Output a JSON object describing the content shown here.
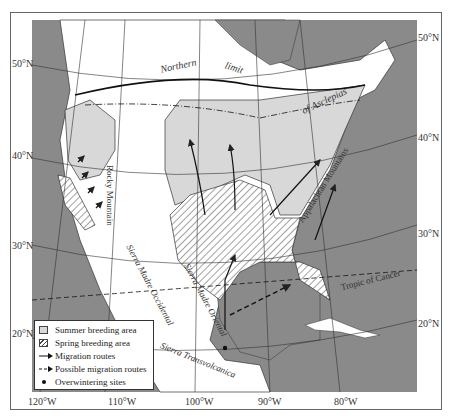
{
  "map": {
    "title": "Monarch butterfly breeding areas and migration routes, North America",
    "lat_labels_left": [
      "50°N",
      "40°N",
      "30°N",
      "20°N"
    ],
    "lat_labels_right": [
      "50°N",
      "40°N",
      "30°N",
      "20°N"
    ],
    "lon_labels": [
      "120°W",
      "110°W",
      "100°W",
      "90°W",
      "80°W"
    ],
    "features": {
      "northern_limit": [
        "Northern",
        "limit",
        "of Asclepias"
      ],
      "rocky": "Rocky Mountain",
      "appalachian": "Appalachian Mountains",
      "smo": "Sierra Madre Occidental",
      "smor": "Sierra Madre Oriental",
      "stv": "Sierra Transvolcanica",
      "tropic": "Tropic of Cancer"
    },
    "colors": {
      "ocean": "#8a8a8a",
      "summer": "#d8d8d8",
      "land": "#ffffff",
      "line": "#222222"
    }
  },
  "legend": {
    "items": [
      {
        "label": "Summer breeding area",
        "symbol": "gray-square"
      },
      {
        "label": "Spring breeding area",
        "symbol": "hatched-square"
      },
      {
        "label": "Migration routes",
        "symbol": "solid-arrow"
      },
      {
        "label": "Possible migration routes",
        "symbol": "dashed-arrow"
      },
      {
        "label": "Overwintering sites",
        "symbol": "dot"
      }
    ]
  }
}
